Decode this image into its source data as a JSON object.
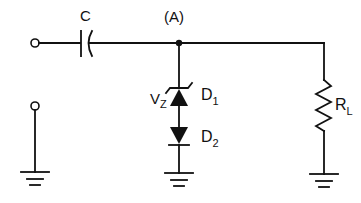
{
  "diagram": {
    "type": "circuit-schematic",
    "labels": {
      "capacitor": "C",
      "node": "(A)",
      "zener_voltage_main": "V",
      "zener_voltage_sub": "Z",
      "diode1_main": "D",
      "diode1_sub": "1",
      "diode2_main": "D",
      "diode2_sub": "2",
      "load_main": "R",
      "load_sub": "L"
    },
    "components": [
      {
        "id": "C",
        "kind": "capacitor",
        "position": "series in top line"
      },
      {
        "id": "D1",
        "kind": "zener-diode",
        "orientation": "anode-down (cathode to node A)"
      },
      {
        "id": "D2",
        "kind": "diode",
        "orientation": "cathode-down to ground"
      },
      {
        "id": "RL",
        "kind": "resistor",
        "position": "shunt from top line to ground"
      }
    ],
    "terminals": [
      "input-top",
      "input-bottom"
    ],
    "grounds": 3,
    "colors": {
      "ink": "#111111",
      "background": "#ffffff"
    }
  }
}
